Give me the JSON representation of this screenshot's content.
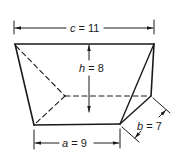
{
  "diagram": {
    "type": "frustum-wedge",
    "colors": {
      "line": "#1a1a1a",
      "background": "#ffffff"
    },
    "labels": {
      "c": {
        "var": "c",
        "eq": " = 11",
        "text": "c = 11"
      },
      "h": {
        "var": "h",
        "eq": " = 8",
        "text": "h = 8"
      },
      "a": {
        "var": "a",
        "eq": " = 9",
        "text": "a = 9"
      },
      "b": {
        "var": "b",
        "eq": " = 7",
        "text": "b = 7"
      }
    }
  }
}
